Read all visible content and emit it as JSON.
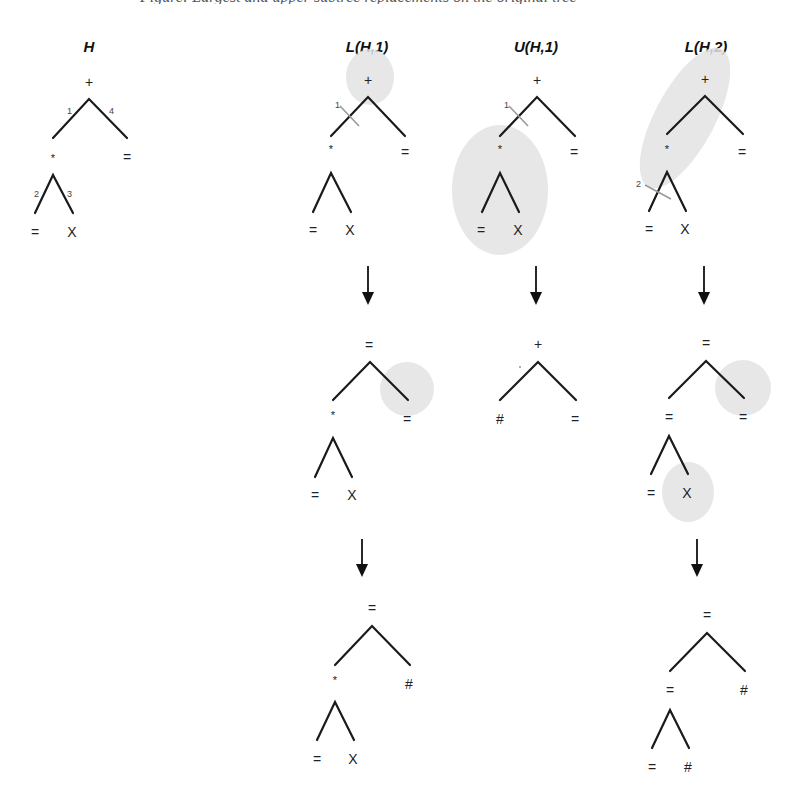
{
  "caption_cut": "Figure: Largest and upper subtree replacements on the original tree",
  "columns": [
    {
      "id": "H",
      "title": "H"
    },
    {
      "id": "L1",
      "title": "L(H,1)"
    },
    {
      "id": "U1",
      "title": "U(H,1)"
    },
    {
      "id": "L2",
      "title": "L(H,2)"
    }
  ],
  "trees": {
    "H": {
      "root": "+",
      "left": "*",
      "right": "=",
      "left_left": "=",
      "left_right": "X",
      "edge_labels": {
        "e1": "1",
        "e2": "2",
        "e3": "3",
        "e4": "4"
      }
    },
    "L1_0": {
      "root": "+",
      "left": "*",
      "right": "=",
      "left_left": "=",
      "left_right": "X",
      "cut_label": "1"
    },
    "L1_1": {
      "root": "=",
      "left": "*",
      "right": "=",
      "left_left": "=",
      "left_right": "X"
    },
    "L1_2": {
      "root": "=",
      "left": "*",
      "right": "#",
      "left_left": "=",
      "left_right": "X"
    },
    "U1_0": {
      "root": "+",
      "left": "*",
      "right": "=",
      "left_left": "=",
      "left_right": "X",
      "cut_label": "1"
    },
    "U1_1": {
      "root": "+",
      "left": "#",
      "right": "="
    },
    "L2_0": {
      "root": "+",
      "left": "*",
      "right": "=",
      "left_left": "=",
      "left_right": "X",
      "cut_label": "2"
    },
    "L2_1": {
      "root": "=",
      "left": "=",
      "right": "=",
      "left_left": "=",
      "left_right": "X"
    },
    "L2_2": {
      "root": "=",
      "left": "=",
      "right": "#",
      "left_left": "=",
      "left_right": "#"
    }
  },
  "colors": {
    "edge": "#1a1a1a",
    "shade": "#e3e3e3",
    "cut": "#9a9a9a"
  }
}
